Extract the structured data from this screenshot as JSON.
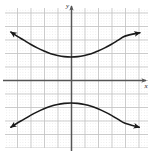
{
  "figure": {
    "title": "",
    "background_color": "#ffffff",
    "width": 153,
    "height": 154
  },
  "axes": {
    "x_label": "x",
    "y_label": "y",
    "axis_color": "#555555",
    "origin_px": {
      "x": 71,
      "y": 80
    },
    "grid": {
      "major_color": "#cccccc",
      "minor_color": "#dddddd",
      "major_spacing_px": 13.5,
      "minor_spacing_px": 2.7,
      "style": "dotted",
      "visible": true,
      "plot_left_px": 5,
      "plot_right_px": 148,
      "plot_top_px": 8,
      "plot_bottom_px": 148
    },
    "arrows": {
      "x_positive": true,
      "y_positive": true
    }
  },
  "chart_data": {
    "type": "line",
    "title": "",
    "xlabel": "x",
    "ylabel": "y",
    "grid": true,
    "legend": null,
    "xlim": [
      -5,
      5.5
    ],
    "ylim": [
      -5,
      5.5
    ],
    "curve_color": "#1a1a1a",
    "series": [
      {
        "name": "upper branch",
        "arrowheads": [
          "start",
          "end"
        ],
        "points": [
          {
            "x": -4.45,
            "y": 3.55
          },
          {
            "x": -4.0,
            "y": 3.25
          },
          {
            "x": -3.5,
            "y": 2.95
          },
          {
            "x": -3.0,
            "y": 2.65
          },
          {
            "x": -2.5,
            "y": 2.38
          },
          {
            "x": -2.0,
            "y": 2.15
          },
          {
            "x": -1.5,
            "y": 1.95
          },
          {
            "x": -1.0,
            "y": 1.82
          },
          {
            "x": -0.5,
            "y": 1.73
          },
          {
            "x": 0.0,
            "y": 1.7
          },
          {
            "x": 0.5,
            "y": 1.73
          },
          {
            "x": 1.0,
            "y": 1.82
          },
          {
            "x": 1.5,
            "y": 1.95
          },
          {
            "x": 2.0,
            "y": 2.15
          },
          {
            "x": 2.5,
            "y": 2.38
          },
          {
            "x": 3.0,
            "y": 2.65
          },
          {
            "x": 3.5,
            "y": 2.95
          },
          {
            "x": 4.0,
            "y": 3.25
          },
          {
            "x": 5.1,
            "y": 3.5
          }
        ]
      },
      {
        "name": "lower branch",
        "arrowheads": [
          "start",
          "end"
        ],
        "points": [
          {
            "x": -4.45,
            "y": -3.5
          },
          {
            "x": -4.0,
            "y": -3.2
          },
          {
            "x": -3.5,
            "y": -2.92
          },
          {
            "x": -3.0,
            "y": -2.62
          },
          {
            "x": -2.5,
            "y": -2.36
          },
          {
            "x": -2.0,
            "y": -2.13
          },
          {
            "x": -1.5,
            "y": -1.94
          },
          {
            "x": -1.0,
            "y": -1.81
          },
          {
            "x": -0.5,
            "y": -1.73
          },
          {
            "x": 0.0,
            "y": -1.7
          },
          {
            "x": 0.5,
            "y": -1.73
          },
          {
            "x": 1.0,
            "y": -1.81
          },
          {
            "x": 1.5,
            "y": -1.94
          },
          {
            "x": 2.0,
            "y": -2.13
          },
          {
            "x": 2.5,
            "y": -2.36
          },
          {
            "x": 3.0,
            "y": -2.62
          },
          {
            "x": 3.5,
            "y": -2.92
          },
          {
            "x": 4.0,
            "y": -3.2
          },
          {
            "x": 5.05,
            "y": -3.5
          }
        ]
      }
    ]
  }
}
